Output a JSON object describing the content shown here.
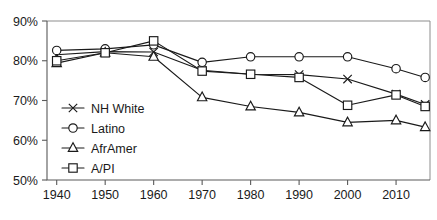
{
  "chart_data": {
    "type": "line",
    "title": "",
    "xlabel": "",
    "ylabel": "",
    "xlim": [
      1938,
      2017
    ],
    "ylim": [
      50,
      90
    ],
    "grid": false,
    "legend_position": "lower-left-inside",
    "x": [
      1940,
      1950,
      1960,
      1970,
      1980,
      1990,
      2000,
      2010,
      2016
    ],
    "xticks": [
      "1940",
      "1950",
      "1960",
      "1970",
      "1980",
      "1990",
      "2000",
      "2010"
    ],
    "xtick_values": [
      1940,
      1950,
      1960,
      1970,
      1980,
      1990,
      2000,
      2010
    ],
    "yticks": [
      "50%",
      "60%",
      "70%",
      "80%",
      "90%"
    ],
    "ytick_values": [
      50,
      60,
      70,
      80,
      90
    ],
    "series": [
      {
        "name": "NH White",
        "marker": "x",
        "values": [
          81.5,
          82.3,
          82.2,
          77.6,
          76.6,
          76.5,
          75.4,
          71.6,
          69.0
        ]
      },
      {
        "name": "Latino",
        "marker": "circle",
        "values": [
          82.6,
          83.0,
          84.0,
          79.6,
          81.0,
          81.0,
          81.0,
          78.0,
          75.8
        ]
      },
      {
        "name": "AfrAmer",
        "marker": "triangle",
        "values": [
          79.4,
          82.0,
          81.0,
          70.8,
          68.5,
          67.0,
          64.5,
          65.0,
          63.3
        ]
      },
      {
        "name": "A/PI",
        "marker": "square",
        "values": [
          80.0,
          82.0,
          85.0,
          77.4,
          76.6,
          75.8,
          68.8,
          71.4,
          68.5
        ]
      }
    ]
  },
  "legend": {
    "entries": [
      {
        "label": "NH White",
        "marker": "x"
      },
      {
        "label": "Latino",
        "marker": "circle"
      },
      {
        "label": "AfrAmer",
        "marker": "triangle"
      },
      {
        "label": "A/PI",
        "marker": "square"
      }
    ]
  },
  "colors": {
    "ink": "#1a1a1a",
    "axis": "#5a5a5a",
    "frame": "#8d8d8d",
    "background": "#ffffff"
  }
}
